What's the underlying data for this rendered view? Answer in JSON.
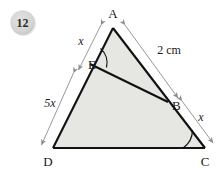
{
  "question": {
    "number": "12",
    "badge_fill": "#d6d6d4",
    "badge_text_color": "#2b2b2b"
  },
  "figure": {
    "fill_color": "#e6e6e3",
    "stroke_color": "#111111",
    "arrow_color": "#8c8c8c",
    "vertices": [
      {
        "name": "A",
        "label": "A",
        "x": 113,
        "y": 28
      },
      {
        "name": "B",
        "label": "B",
        "x": 168,
        "y": 102
      },
      {
        "name": "C",
        "label": "C",
        "x": 205,
        "y": 148
      },
      {
        "name": "D",
        "label": "D",
        "x": 53,
        "y": 148
      },
      {
        "name": "E",
        "label": "E",
        "x": 90,
        "y": 64
      }
    ],
    "measurements": [
      {
        "name": "AE",
        "label": "x",
        "italic": true,
        "from": "A",
        "to": "E",
        "side": "left"
      },
      {
        "name": "ED",
        "label": "5x",
        "italic": true,
        "from": "E",
        "to": "D",
        "side": "left"
      },
      {
        "name": "AB",
        "label": "2 cm",
        "italic": false,
        "from": "A",
        "to": "B",
        "side": "right"
      },
      {
        "name": "BC",
        "label": "x",
        "italic": true,
        "from": "B",
        "to": "C",
        "side": "right"
      }
    ],
    "angle_marks": [
      {
        "name": "angle-at-E",
        "vertex": "E"
      },
      {
        "name": "angle-at-C",
        "vertex": "C"
      }
    ],
    "segments": [
      {
        "name": "side-AD",
        "from": "A",
        "to": "D"
      },
      {
        "name": "side-AC",
        "from": "A",
        "to": "C"
      },
      {
        "name": "side-DC",
        "from": "D",
        "to": "C"
      },
      {
        "name": "segment-EB",
        "from": "E",
        "to": "B"
      }
    ]
  }
}
